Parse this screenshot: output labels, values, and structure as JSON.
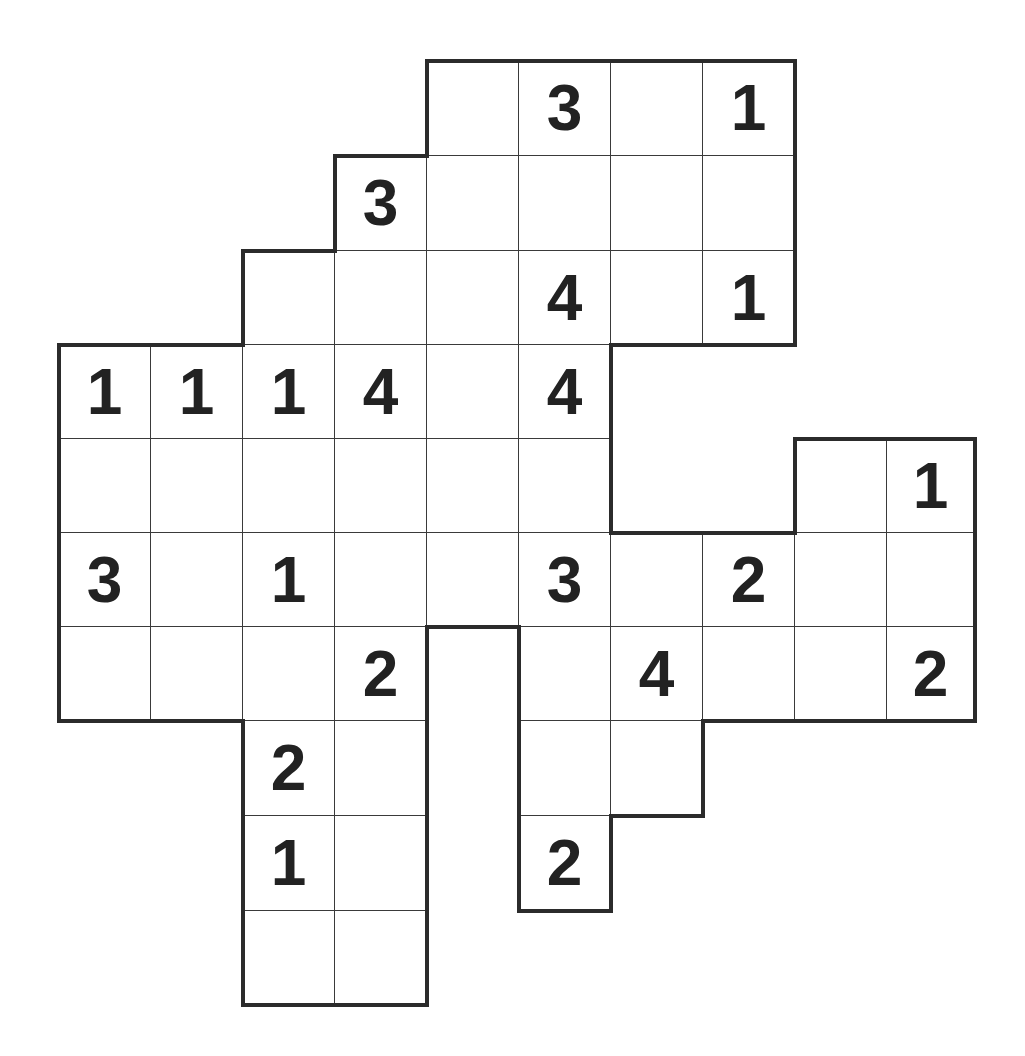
{
  "puzzle": {
    "type": "number-grid-puzzle",
    "columns": 10,
    "rows": 10,
    "grid_origin": [
      58,
      60
    ],
    "col_lines": [
      58,
      150,
      242,
      334,
      426,
      518,
      610,
      702,
      794,
      886,
      974
    ],
    "row_lines": [
      60,
      155,
      250,
      344,
      438,
      532,
      626,
      720,
      815,
      910,
      1004
    ],
    "line_color": "#3a3a3a",
    "border_color": "#2b2b2b",
    "digit_color": "#222222",
    "cells": [
      {
        "r": 0,
        "c": 4,
        "v": ""
      },
      {
        "r": 0,
        "c": 5,
        "v": "3"
      },
      {
        "r": 0,
        "c": 6,
        "v": ""
      },
      {
        "r": 0,
        "c": 7,
        "v": "1"
      },
      {
        "r": 1,
        "c": 3,
        "v": "3"
      },
      {
        "r": 1,
        "c": 4,
        "v": ""
      },
      {
        "r": 1,
        "c": 5,
        "v": ""
      },
      {
        "r": 1,
        "c": 6,
        "v": ""
      },
      {
        "r": 1,
        "c": 7,
        "v": ""
      },
      {
        "r": 2,
        "c": 2,
        "v": ""
      },
      {
        "r": 2,
        "c": 3,
        "v": ""
      },
      {
        "r": 2,
        "c": 4,
        "v": ""
      },
      {
        "r": 2,
        "c": 5,
        "v": "4"
      },
      {
        "r": 2,
        "c": 6,
        "v": ""
      },
      {
        "r": 2,
        "c": 7,
        "v": "1"
      },
      {
        "r": 3,
        "c": 0,
        "v": "1"
      },
      {
        "r": 3,
        "c": 1,
        "v": "1"
      },
      {
        "r": 3,
        "c": 2,
        "v": "1"
      },
      {
        "r": 3,
        "c": 3,
        "v": "4"
      },
      {
        "r": 3,
        "c": 4,
        "v": ""
      },
      {
        "r": 3,
        "c": 5,
        "v": "4"
      },
      {
        "r": 4,
        "c": 0,
        "v": ""
      },
      {
        "r": 4,
        "c": 1,
        "v": ""
      },
      {
        "r": 4,
        "c": 2,
        "v": ""
      },
      {
        "r": 4,
        "c": 3,
        "v": ""
      },
      {
        "r": 4,
        "c": 4,
        "v": ""
      },
      {
        "r": 4,
        "c": 5,
        "v": ""
      },
      {
        "r": 4,
        "c": 8,
        "v": ""
      },
      {
        "r": 4,
        "c": 9,
        "v": "1"
      },
      {
        "r": 5,
        "c": 0,
        "v": "3"
      },
      {
        "r": 5,
        "c": 1,
        "v": ""
      },
      {
        "r": 5,
        "c": 2,
        "v": "1"
      },
      {
        "r": 5,
        "c": 3,
        "v": ""
      },
      {
        "r": 5,
        "c": 4,
        "v": ""
      },
      {
        "r": 5,
        "c": 5,
        "v": "3"
      },
      {
        "r": 5,
        "c": 6,
        "v": ""
      },
      {
        "r": 5,
        "c": 7,
        "v": "2"
      },
      {
        "r": 5,
        "c": 8,
        "v": ""
      },
      {
        "r": 5,
        "c": 9,
        "v": ""
      },
      {
        "r": 6,
        "c": 0,
        "v": ""
      },
      {
        "r": 6,
        "c": 1,
        "v": ""
      },
      {
        "r": 6,
        "c": 2,
        "v": ""
      },
      {
        "r": 6,
        "c": 3,
        "v": "2"
      },
      {
        "r": 6,
        "c": 5,
        "v": ""
      },
      {
        "r": 6,
        "c": 6,
        "v": "4"
      },
      {
        "r": 6,
        "c": 7,
        "v": ""
      },
      {
        "r": 6,
        "c": 8,
        "v": ""
      },
      {
        "r": 6,
        "c": 9,
        "v": "2"
      },
      {
        "r": 7,
        "c": 2,
        "v": "2"
      },
      {
        "r": 7,
        "c": 3,
        "v": ""
      },
      {
        "r": 7,
        "c": 5,
        "v": ""
      },
      {
        "r": 7,
        "c": 6,
        "v": ""
      },
      {
        "r": 8,
        "c": 2,
        "v": "1"
      },
      {
        "r": 8,
        "c": 3,
        "v": ""
      },
      {
        "r": 8,
        "c": 5,
        "v": "2"
      },
      {
        "r": 9,
        "c": 2,
        "v": ""
      },
      {
        "r": 9,
        "c": 3,
        "v": ""
      }
    ]
  }
}
